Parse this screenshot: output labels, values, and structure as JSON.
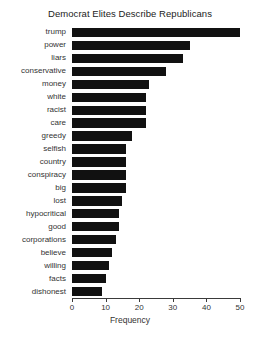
{
  "chart_data": {
    "type": "bar",
    "orientation": "horizontal",
    "title": "Democrat Elites Describe Republicans",
    "xlabel": "Frequency",
    "ylabel": "",
    "xlim": [
      0,
      50
    ],
    "xticks": [
      0,
      10,
      20,
      30,
      40,
      50
    ],
    "xtick_labels": [
      "0",
      "10",
      "20",
      "30",
      "40",
      "50"
    ],
    "grid": false,
    "legend": null,
    "bar_color": "#111111",
    "background_color": "#ffffff",
    "categories": [
      "trump",
      "power",
      "liars",
      "conservative",
      "money",
      "white",
      "racist",
      "care",
      "greedy",
      "selfish",
      "country",
      "conspiracy",
      "big",
      "lost",
      "hypocritical",
      "good",
      "corporations",
      "believe",
      "willing",
      "facts",
      "dishonest"
    ],
    "values": [
      50,
      35,
      33,
      28,
      23,
      22,
      22,
      22,
      18,
      16,
      16,
      16,
      16,
      15,
      14,
      14,
      13,
      12,
      11,
      10,
      9
    ]
  }
}
